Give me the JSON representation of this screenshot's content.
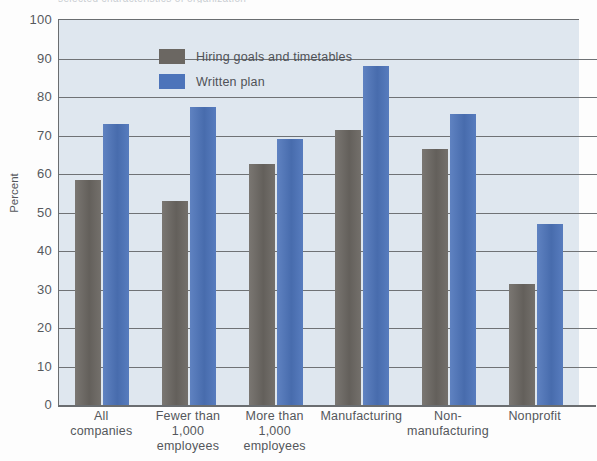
{
  "caption_sliver": "selected characteristics of organization",
  "axes": {
    "ylabel": "Percent",
    "yticks": [
      "100",
      "90",
      "80",
      "70",
      "60",
      "50",
      "40",
      "30",
      "20",
      "10",
      "0"
    ]
  },
  "legend": {
    "items": [
      {
        "label": "Hiring goals and timetables",
        "color": "#6b6762",
        "key": "goals"
      },
      {
        "label": "Written plan",
        "color": "#4d74ba",
        "key": "plan"
      }
    ]
  },
  "chart_data": {
    "type": "bar",
    "title": "",
    "xlabel": "",
    "ylabel": "Percent",
    "ylim": [
      0,
      100
    ],
    "ytick_step": 10,
    "grid": true,
    "legend_position": "top-left-inside",
    "categories": [
      "All companies",
      "Fewer than 1,000 employees",
      "More than 1,000 employees",
      "Manufacturing",
      "Non-manufacturing",
      "Nonprofit"
    ],
    "category_lines": [
      [
        "All",
        "companies"
      ],
      [
        "Fewer than",
        "1,000",
        "employees"
      ],
      [
        "More than",
        "1,000",
        "employees"
      ],
      [
        "Manufacturing"
      ],
      [
        "Non-",
        "manufacturing"
      ],
      [
        "Nonprofit"
      ]
    ],
    "series": [
      {
        "name": "Hiring goals and timetables",
        "color": "#6b6762",
        "values": [
          58.5,
          53,
          62.5,
          71.5,
          66.5,
          31.5
        ]
      },
      {
        "name": "Written plan",
        "color": "#4d74ba",
        "values": [
          73,
          77.5,
          69,
          88,
          75.5,
          47
        ]
      }
    ]
  }
}
